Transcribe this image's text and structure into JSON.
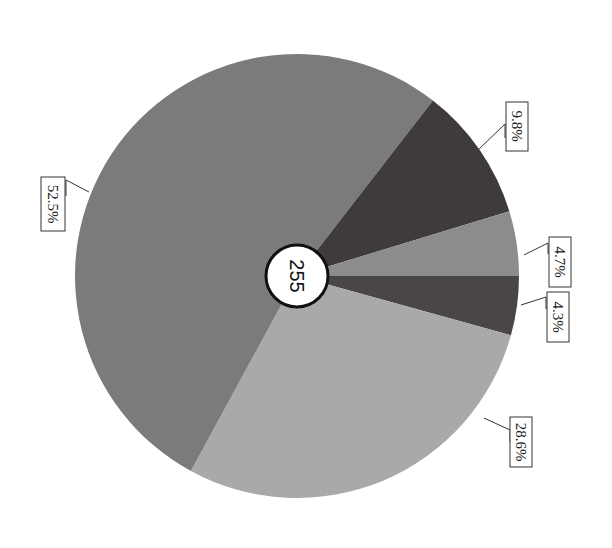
{
  "chart_data": {
    "type": "pie",
    "title": "",
    "center_label": "255",
    "rotation_note": "chart rendered rotated 90 degrees clockwise",
    "slices": [
      {
        "label": "4.3%",
        "value": 4.3,
        "color": "#4a4646"
      },
      {
        "label": "28.6%",
        "value": 28.6,
        "color": "#a9a9a7"
      },
      {
        "label": "52.5%",
        "value": 52.5,
        "color": "#7b7b7a"
      },
      {
        "label": "9.8%",
        "value": 9.8,
        "color": "#3f3b3b"
      },
      {
        "label": "4.7%",
        "value": 4.7,
        "color": "#8c8c8b"
      }
    ],
    "start_angle_deg": 0,
    "direction": "clockwise",
    "legend": "none"
  },
  "labels": {
    "s0": "4.3%",
    "s1": "28.6%",
    "s2": "52.5%",
    "s3": "9.8%",
    "s4": "4.7%",
    "center": "255"
  }
}
